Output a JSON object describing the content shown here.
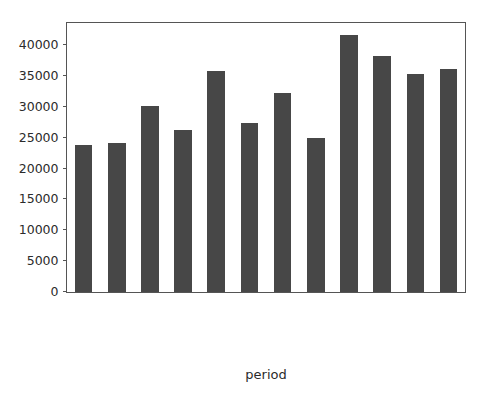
{
  "chart_data": {
    "type": "bar",
    "title": "",
    "xlabel": "period",
    "ylabel": "",
    "categories": [
      "2019-01-01",
      "2019-02-01",
      "2019-03-01",
      "2019-04-01",
      "2019-05-01",
      "2019-06-01",
      "2019-07-01",
      "2019-08-01",
      "2019-09-01",
      "2019-10-01",
      "2019-11-01",
      "2019-12-01"
    ],
    "values": [
      23800,
      24100,
      30100,
      26300,
      35900,
      27400,
      32200,
      25000,
      41600,
      38300,
      35400,
      36200
    ],
    "ylim": [
      0,
      43600
    ],
    "xlim_categories": 12,
    "yticks": [
      0,
      5000,
      10000,
      15000,
      20000,
      25000,
      30000,
      35000,
      40000
    ],
    "ytick_labels": [
      "0",
      "5000",
      "10000",
      "15000",
      "20000",
      "25000",
      "30000",
      "35000",
      "40000"
    ],
    "grid": false,
    "legend": null,
    "legend_position": "none",
    "bar_color": "#474747",
    "axes_color": "#555555",
    "background_color": "#ffffff",
    "text_color": "#2b2b2b"
  }
}
